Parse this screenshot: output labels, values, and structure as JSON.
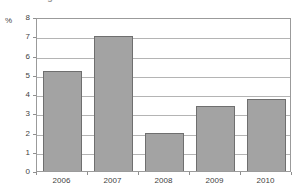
{
  "title_fragment": "Real GDP growth in %",
  "chart_data": {
    "type": "bar",
    "title": "",
    "xlabel": "",
    "ylabel": "%",
    "categories": [
      "2006",
      "2007",
      "2008",
      "2009",
      "2010"
    ],
    "values": [
      5.2,
      7.0,
      2.0,
      3.4,
      3.75
    ],
    "ylim": [
      0,
      8
    ],
    "ytick_labels": [
      "0",
      "1",
      "2",
      "3",
      "4",
      "5",
      "6",
      "7",
      "8"
    ],
    "ytick_values": [
      0,
      1,
      2,
      3,
      4,
      5,
      6,
      7,
      8
    ],
    "grid": true,
    "legend": "none",
    "bar_color": "#a3a3a3",
    "bar_border_color": "#6f6f6f",
    "grid_color": "#b4b4b4",
    "frame_color": "#9b9b9b"
  }
}
